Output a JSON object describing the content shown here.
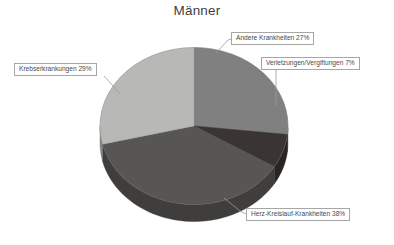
{
  "chart_data": {
    "type": "pie",
    "title": "Männer",
    "xlabel": "",
    "ylabel": "",
    "legend_position": "none",
    "grid": false,
    "three_d": true,
    "categories": [
      "Andere Krankheiten",
      "Verletzungen/Vergiftungen",
      "Herz-Kreislauf-Krankheiten",
      "Krebserkrankungen"
    ],
    "values": [
      27,
      7,
      38,
      29
    ],
    "unit": "%",
    "slices": [
      {
        "label": "Andere Krankheiten",
        "value": 27,
        "display": "Andere Krankheiten 27%",
        "color": "#808080"
      },
      {
        "label": "Verletzungen/Vergiftungen",
        "value": 7,
        "display": "Verletzungen/Vergiftungen 7%",
        "color": "#3a3432"
      },
      {
        "label": "Herz-Kreislauf-Krankheiten",
        "value": 38,
        "display": "Herz-Kreislauf-Krankheiten 38%",
        "color": "#585654"
      },
      {
        "label": "Krebserkrankungen",
        "value": 29,
        "display": "Krebserkrankungen 29%",
        "color": "#b8b8b6"
      }
    ]
  },
  "colors": {
    "background": "#ffffff",
    "title_text": "#3f3f3f",
    "label_text": "#4a4a4a",
    "label_border": "#a6a6a6",
    "leader_line": "#9a9a9a",
    "slice_andere": "#808080",
    "slice_verletzungen": "#3a3432",
    "slice_herz": "#585654",
    "slice_krebs": "#b8b8b6"
  }
}
